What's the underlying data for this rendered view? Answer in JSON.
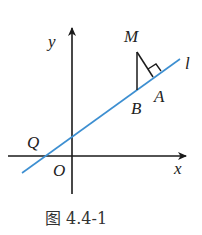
{
  "figure": {
    "caption": "图 4.4-1",
    "labels": {
      "y_axis": "y",
      "x_axis": "x",
      "origin": "O",
      "point_m": "M",
      "point_a": "A",
      "point_b": "B",
      "point_q": "Q",
      "line_l": "l"
    },
    "colors": {
      "line_l": "#3d8fd1",
      "axes": "#1a1a1a",
      "segments": "#1a1a1a"
    }
  }
}
